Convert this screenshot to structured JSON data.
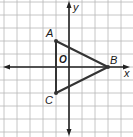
{
  "diagram": {
    "type": "coordinate-plane",
    "grid": {
      "unit_px": 13,
      "origin_px": [
        69,
        67
      ],
      "x_range": [
        -5,
        5
      ],
      "y_range": [
        -5,
        5
      ]
    },
    "axes": {
      "x_label": "x",
      "y_label": "y",
      "origin_label": "O"
    },
    "points": [
      {
        "name": "A",
        "x": -1,
        "y": 2
      },
      {
        "name": "B",
        "x": 3,
        "y": 0
      },
      {
        "name": "C",
        "x": -1,
        "y": -2
      }
    ],
    "segments": [
      [
        "A",
        "B"
      ],
      [
        "B",
        "C"
      ],
      [
        "C",
        "A"
      ]
    ],
    "colors": {
      "grid": "#b8b8b8",
      "axis": "#222222",
      "triangle": "#333333",
      "background": "#ffffff"
    }
  }
}
